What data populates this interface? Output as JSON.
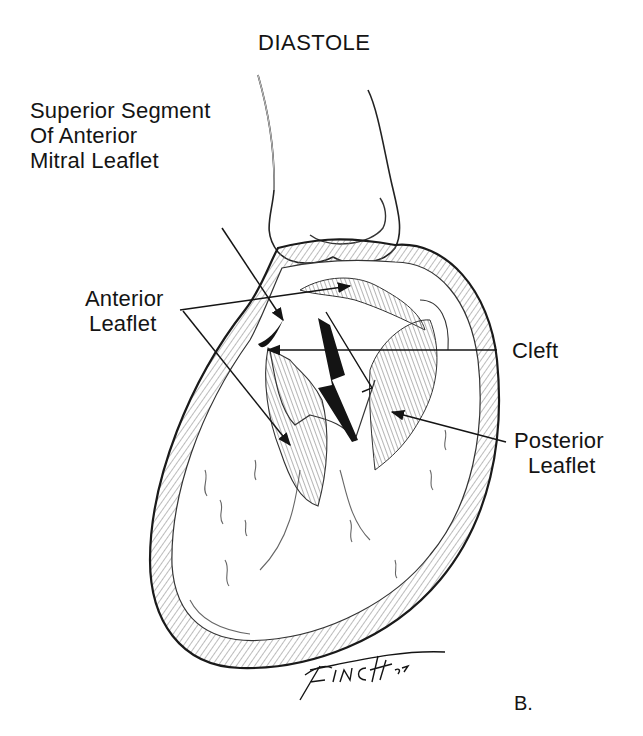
{
  "title": "DIASTOLE",
  "figure_label": "B.",
  "signature": "FINCH '82",
  "labels": {
    "superior_segment": [
      "Superior Segment",
      "Of Anterior",
      "Mitral Leaflet"
    ],
    "anterior_leaflet": [
      "Anterior",
      "Leaflet"
    ],
    "cleft": [
      "Cleft"
    ],
    "posterior_leaflet": [
      "Posterior",
      "Leaflet"
    ]
  },
  "colors": {
    "ink": "#141414",
    "background": "#ffffff",
    "shading": "#8a8a8a"
  }
}
